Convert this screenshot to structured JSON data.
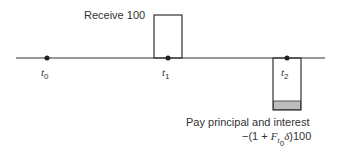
{
  "timeline": {
    "points": [
      {
        "label": "t",
        "sub": "0",
        "x": 47
      },
      {
        "label": "t",
        "sub": "1",
        "x": 168
      },
      {
        "label": "t",
        "sub": "2",
        "x": 287
      }
    ]
  },
  "receive": {
    "label": "Receive 100"
  },
  "pay": {
    "label": "Pay principal and interest",
    "formula_prefix": "−(1 + ",
    "formula_var": "F",
    "formula_sub": "t",
    "formula_subsub": "0",
    "formula_delta": "δ",
    "formula_suffix": ")100"
  },
  "colors": {
    "line": "#333333",
    "shade": "#bdbdbd"
  }
}
